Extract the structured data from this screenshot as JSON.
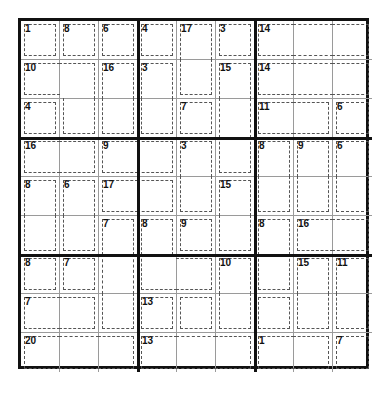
{
  "puzzle": {
    "type": "killer-sudoku",
    "size": 9,
    "box_size": 3,
    "cage_map": [
      "ABCDEFGGG",
      "HHIJEKLLL",
      "MHIJNKOOP",
      "QQRRSKTUV",
      "WXYYSZTUV",
      "WXabcZdee",
      "fgabbhdij",
      "kkalmhnij",
      "nnnoooppq"
    ],
    "cages": {
      "A": {
        "sum": "1",
        "anchor": [
          0,
          0
        ]
      },
      "B": {
        "sum": "8",
        "anchor": [
          0,
          1
        ]
      },
      "C": {
        "sum": "6",
        "anchor": [
          0,
          2
        ]
      },
      "D": {
        "sum": "4",
        "anchor": [
          0,
          3
        ]
      },
      "E": {
        "sum": "17",
        "anchor": [
          0,
          4
        ]
      },
      "F": {
        "sum": "3",
        "anchor": [
          0,
          5
        ]
      },
      "G": {
        "sum": "14",
        "anchor": [
          0,
          6
        ]
      },
      "H": {
        "sum": "10",
        "anchor": [
          1,
          0
        ]
      },
      "I": {
        "sum": "16",
        "anchor": [
          1,
          2
        ]
      },
      "J": {
        "sum": "3",
        "anchor": [
          1,
          3
        ]
      },
      "K": {
        "sum": "15",
        "anchor": [
          1,
          5
        ]
      },
      "L": {
        "sum": "14",
        "anchor": [
          1,
          6
        ]
      },
      "M": {
        "sum": "4",
        "anchor": [
          2,
          0
        ]
      },
      "N": {
        "sum": "7",
        "anchor": [
          2,
          4
        ]
      },
      "O": {
        "sum": "11",
        "anchor": [
          2,
          6
        ]
      },
      "P": {
        "sum": "6",
        "anchor": [
          2,
          8
        ]
      },
      "Q": {
        "sum": "16",
        "anchor": [
          3,
          0
        ]
      },
      "R": {
        "sum": "9",
        "anchor": [
          3,
          2
        ]
      },
      "S": {
        "sum": "3",
        "anchor": [
          3,
          4
        ]
      },
      "T": {
        "sum": "8",
        "anchor": [
          3,
          6
        ]
      },
      "U": {
        "sum": "9",
        "anchor": [
          3,
          7
        ]
      },
      "V": {
        "sum": "6",
        "anchor": [
          3,
          8
        ]
      },
      "W": {
        "sum": "8",
        "anchor": [
          4,
          0
        ]
      },
      "X": {
        "sum": "6",
        "anchor": [
          4,
          1
        ]
      },
      "Y": {
        "sum": "17",
        "anchor": [
          4,
          2
        ]
      },
      "Z": {
        "sum": "15",
        "anchor": [
          4,
          5
        ]
      },
      "a": {
        "sum": "7",
        "anchor": [
          5,
          2
        ]
      },
      "b": {
        "sum": "8",
        "anchor": [
          5,
          3
        ]
      },
      "c": {
        "sum": "9",
        "anchor": [
          5,
          4
        ]
      },
      "d": {
        "sum": "8",
        "anchor": [
          5,
          6
        ]
      },
      "e": {
        "sum": "16",
        "anchor": [
          5,
          7
        ]
      },
      "f": {
        "sum": "8",
        "anchor": [
          6,
          0
        ]
      },
      "g": {
        "sum": "7",
        "anchor": [
          6,
          1
        ]
      },
      "h": {
        "sum": "10",
        "anchor": [
          6,
          5
        ]
      },
      "i": {
        "sum": "15",
        "anchor": [
          6,
          7
        ]
      },
      "j": {
        "sum": "11",
        "anchor": [
          6,
          8
        ]
      },
      "k": {
        "sum": "7",
        "anchor": [
          7,
          0
        ]
      },
      "l": {
        "sum": "13",
        "anchor": [
          7,
          3
        ]
      },
      "m": {
        "sum": "9",
        "anchor": [
          7,
          6
        ]
      },
      "n": {
        "sum": "20",
        "anchor": [
          8,
          0
        ]
      },
      "o": {
        "sum": "13",
        "anchor": [
          8,
          3
        ]
      },
      "p": {
        "sum": "1",
        "anchor": [
          8,
          6
        ]
      },
      "q": {
        "sum": "7",
        "anchor": [
          8,
          8
        ]
      }
    },
    "colors": {
      "background": "#ffffff",
      "box_border": "#111111",
      "cell_border": "#9a9a9a",
      "cage_border": "#555555",
      "clue_text": "#111111"
    }
  }
}
